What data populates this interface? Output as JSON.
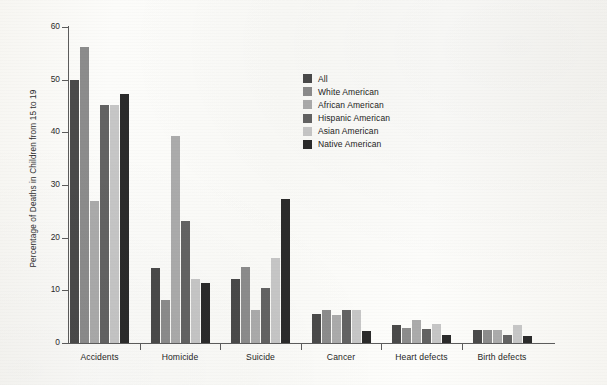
{
  "chart_data": {
    "type": "bar",
    "title": "",
    "xlabel": "",
    "ylabel": "Percentage of Deaths in Children from 15 to 19",
    "ylim": [
      0,
      60
    ],
    "yticks": [
      0,
      10,
      20,
      30,
      40,
      50,
      60
    ],
    "grid": false,
    "legend_position": "upper-center-right",
    "categories": [
      "Accidents",
      "Homicide",
      "Suicide",
      "Cancer",
      "Heart defects",
      "Birth defects"
    ],
    "series": [
      {
        "name": "All",
        "color": "#4a4a4a",
        "values": [
          50.0,
          14.2,
          12.1,
          5.5,
          3.5,
          2.5
        ]
      },
      {
        "name": "White American",
        "color": "#8c8c8c",
        "values": [
          56.3,
          8.1,
          14.5,
          6.3,
          2.8,
          2.5
        ]
      },
      {
        "name": "African American",
        "color": "#ababab",
        "values": [
          27.0,
          39.3,
          6.3,
          5.3,
          4.4,
          2.5
        ]
      },
      {
        "name": "Hispanic American",
        "color": "#636363",
        "values": [
          45.2,
          23.2,
          10.4,
          6.3,
          2.7,
          1.5
        ]
      },
      {
        "name": "Asian American",
        "color": "#c6c6c6",
        "values": [
          45.1,
          12.1,
          16.1,
          6.3,
          3.6,
          3.5
        ]
      },
      {
        "name": "Native American",
        "color": "#2b2b2b",
        "values": [
          47.2,
          11.4,
          27.3,
          2.2,
          1.5,
          1.3
        ]
      }
    ]
  },
  "axis": {
    "y_tick_labels": [
      "0",
      "10",
      "20",
      "30",
      "40",
      "50",
      "60"
    ]
  },
  "legend": {
    "items": [
      {
        "label": "All",
        "swatch": "#4a4a4a"
      },
      {
        "label": "White American",
        "swatch": "#8c8c8c"
      },
      {
        "label": "African American",
        "swatch": "#ababab"
      },
      {
        "label": "Hispanic American",
        "swatch": "#636363"
      },
      {
        "label": "Asian American",
        "swatch": "#c6c6c6"
      },
      {
        "label": "Native American",
        "swatch": "#2b2b2b"
      }
    ]
  }
}
